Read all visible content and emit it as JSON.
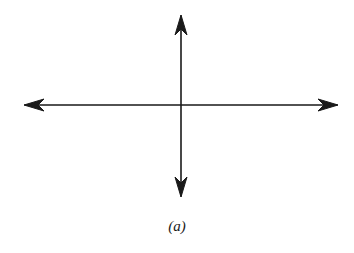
{
  "figure": {
    "caption": "(a)",
    "stroke_color": "#1a1a1a",
    "background": "#ffffff",
    "axes": {
      "origin": [
        181,
        105
      ],
      "horizontal": {
        "from": [
          24,
          105
        ],
        "to": [
          338,
          105
        ],
        "arrows": [
          "left",
          "right"
        ]
      },
      "vertical": {
        "from": [
          181,
          15
        ],
        "to": [
          181,
          197
        ],
        "arrows": [
          "up",
          "down"
        ]
      }
    }
  }
}
